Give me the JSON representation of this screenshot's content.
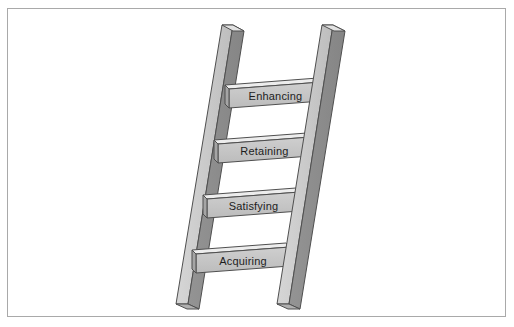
{
  "figure": {
    "type": "ladder-diagram",
    "title": "",
    "frame": {
      "border_color": "#a9a9a9",
      "background_color": "#ffffff"
    },
    "palette": {
      "rail_light_face": "#c9c9c9",
      "rail_dark_face": "#8f8f8f",
      "rail_top_face": "#e2e2e2",
      "rung_face": "#c4c4c4",
      "rung_top_bevel": "#ededed",
      "rung_end_face": "#9c9c9c",
      "outline": "#4a4a4a",
      "text_color": "#1d1d1d"
    },
    "parts": {
      "left_rail_name": "left-rail",
      "right_rail_name": "right-rail"
    }
  },
  "ladder": {
    "rungs": [
      {
        "label": "Enhancing",
        "step": 4,
        "position": "top"
      },
      {
        "label": "Retaining",
        "step": 3,
        "position": "upper-middle"
      },
      {
        "label": "Satisfying",
        "step": 2,
        "position": "lower-middle"
      },
      {
        "label": "Acquiring",
        "step": 1,
        "position": "bottom"
      }
    ]
  }
}
